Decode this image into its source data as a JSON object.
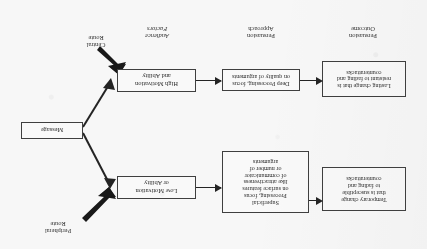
{
  "diagram": {
    "orientation": "rotated-180",
    "boxes": {
      "message": "Message",
      "low_motivation": "Low Motivation\nor Ability",
      "high_motivation": "High Motivation\nand Ability",
      "superficial_processing": "Superficial\nProcessing, focus\non surface features\nlike attractiveness\nof communicator\nor number of\narguments",
      "deep_processing": "Deep Processing, focus\non quality of arguments",
      "temporary_change": "Temporary change\nthat is susceptible\nto fading and\ncounterattacks",
      "lasting_change": "Lasting change that is\nresistant to fading and\ncounterattacks"
    },
    "route_labels": {
      "peripheral": "Peripheral\nRoute",
      "central": "Central\nRoute"
    },
    "column_captions": {
      "audience_factors": "Audience\nFactors",
      "persuasion_approach": "Persuasion\nApproach",
      "persuasion_outcome": "Persuasion\nOutcome"
    },
    "colors": {
      "ink": "#1d1d1d",
      "box_border": "#3a3a3a",
      "box_fill": "#ffffff",
      "page": "#fdfdfd"
    }
  }
}
